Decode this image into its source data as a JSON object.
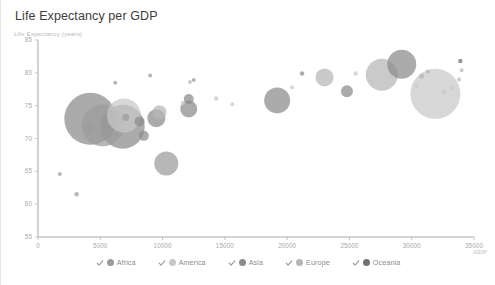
{
  "chart_data": {
    "type": "scatter",
    "title": "Life Expectancy per GDP",
    "xlabel": "GDP",
    "ylabel": "Life Expectancy (years)",
    "xlim": [
      0,
      35000
    ],
    "ylim": [
      55,
      85
    ],
    "xticks": [
      0,
      5000,
      10000,
      15000,
      20000,
      25000,
      30000,
      35000
    ],
    "yticks": [
      55,
      60,
      65,
      70,
      75,
      80,
      85
    ],
    "grid": false,
    "legend_position": "bottom",
    "bubble_note": "Bubble area encodes population; color encodes continent",
    "series": [
      {
        "name": "Africa",
        "color": "#9b9b9b",
        "points": [
          {
            "x": 1750,
            "y": 64.6,
            "r": 2.0
          },
          {
            "x": 3100,
            "y": 61.5,
            "r": 2.2
          },
          {
            "x": 4100,
            "y": 71.5,
            "r": 4.5
          },
          {
            "x": 5200,
            "y": 72.0,
            "r": 21.0
          },
          {
            "x": 6200,
            "y": 78.5,
            "r": 2.0
          },
          {
            "x": 7050,
            "y": 73.2,
            "r": 3.4
          },
          {
            "x": 9000,
            "y": 79.6,
            "r": 2.0
          },
          {
            "x": 10300,
            "y": 66.2,
            "r": 12.0
          },
          {
            "x": 12500,
            "y": 78.9,
            "r": 2.0
          }
        ]
      },
      {
        "name": "America",
        "color": "#c8c8c8",
        "points": [
          {
            "x": 6900,
            "y": 73.5,
            "r": 17.0
          },
          {
            "x": 11650,
            "y": 75.4,
            "r": 2.4
          },
          {
            "x": 14300,
            "y": 76.1,
            "r": 2.2
          },
          {
            "x": 15600,
            "y": 75.2,
            "r": 2.0
          },
          {
            "x": 20400,
            "y": 77.8,
            "r": 2.0
          },
          {
            "x": 22700,
            "y": 79.2,
            "r": 2.0
          },
          {
            "x": 25500,
            "y": 79.9,
            "r": 2.2
          },
          {
            "x": 28200,
            "y": 79.4,
            "r": 2.2
          },
          {
            "x": 30400,
            "y": 78.0,
            "r": 2.0
          },
          {
            "x": 31900,
            "y": 76.8,
            "r": 25.0
          },
          {
            "x": 32600,
            "y": 77.1,
            "r": 2.4
          },
          {
            "x": 33200,
            "y": 77.6,
            "r": 2.0
          }
        ]
      },
      {
        "name": "Asia",
        "color": "#8b8b8b",
        "points": [
          {
            "x": 4200,
            "y": 73.0,
            "r": 26.0
          },
          {
            "x": 6800,
            "y": 71.8,
            "r": 22.0
          },
          {
            "x": 8150,
            "y": 72.6,
            "r": 5.0
          },
          {
            "x": 8500,
            "y": 70.4,
            "r": 5.0
          },
          {
            "x": 9500,
            "y": 73.1,
            "r": 9.0
          },
          {
            "x": 12100,
            "y": 74.5,
            "r": 8.5
          },
          {
            "x": 12100,
            "y": 76.0,
            "r": 5.0
          },
          {
            "x": 19200,
            "y": 75.8,
            "r": 13.0
          },
          {
            "x": 21200,
            "y": 79.9,
            "r": 2.2
          },
          {
            "x": 24800,
            "y": 77.2,
            "r": 6.0
          },
          {
            "x": 29200,
            "y": 81.3,
            "r": 14.5
          }
        ]
      },
      {
        "name": "Europe",
        "color": "#b5b5b5",
        "points": [
          {
            "x": 9750,
            "y": 74.0,
            "r": 7.0
          },
          {
            "x": 12200,
            "y": 78.6,
            "r": 2.0
          },
          {
            "x": 23000,
            "y": 79.3,
            "r": 9.0
          },
          {
            "x": 27600,
            "y": 79.7,
            "r": 16.0
          },
          {
            "x": 30800,
            "y": 79.5,
            "r": 2.5
          },
          {
            "x": 31300,
            "y": 80.2,
            "r": 2.0
          },
          {
            "x": 33800,
            "y": 79.0,
            "r": 2.0
          },
          {
            "x": 34000,
            "y": 80.4,
            "r": 2.0
          }
        ]
      },
      {
        "name": "Oceania",
        "color": "#707070",
        "points": [
          {
            "x": 33900,
            "y": 81.8,
            "r": 2.2
          }
        ]
      }
    ]
  },
  "legend": {
    "items": [
      {
        "label": "Africa",
        "color": "#9b9b9b",
        "checked": true
      },
      {
        "label": "America",
        "color": "#c8c8c8",
        "checked": true
      },
      {
        "label": "Asia",
        "color": "#8b8b8b",
        "checked": true
      },
      {
        "label": "Europe",
        "color": "#b5b5b5",
        "checked": true
      },
      {
        "label": "Oceania",
        "color": "#707070",
        "checked": true
      }
    ]
  },
  "axis": {
    "line_color": "#9e9e9e",
    "tick_color": "#bdbdbd",
    "label_color": "#a8a8a8"
  }
}
